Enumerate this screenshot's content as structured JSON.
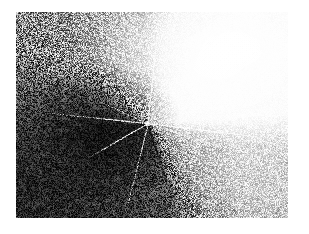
{
  "page": {
    "background_color": "#ffffff",
    "width": 309,
    "height": 234
  },
  "figure": {
    "name": "grainy-grayscale-micrograph",
    "kind": "photographic-plate",
    "plate": {
      "left": 16,
      "top": 12,
      "width": 272,
      "height": 206,
      "border": "none"
    },
    "node": {
      "label": "convergence-node",
      "x_pct": 48.5,
      "y_pct": 54,
      "image_x": 148,
      "image_y": 123
    },
    "grain": {
      "type": "film-grain",
      "strength": "high",
      "cell_px": 2
    },
    "domains": [
      {
        "name": "upper-right-bright-wedge",
        "tone": "near-white",
        "gray_value": 243,
        "hex": "#f3f3f3",
        "start_deg": 18,
        "end_deg": 100
      },
      {
        "name": "right-mid-gray-wedge",
        "tone": "light-gray",
        "gray_value": 200,
        "hex": "#c8c8c8",
        "start_deg": 100,
        "end_deg": 136
      },
      {
        "name": "lower-right-medium-wedge",
        "tone": "medium-gray",
        "gray_value": 152,
        "hex": "#989898",
        "start_deg": 136,
        "end_deg": 160
      },
      {
        "name": "lower-dark-wedge",
        "tone": "very-dark",
        "gray_value": 42,
        "hex": "#2a2a2a",
        "start_deg": 160,
        "end_deg": 268
      },
      {
        "name": "left-dark-wedge",
        "tone": "dark-gray",
        "gray_value": 62,
        "hex": "#3e3e3e",
        "start_deg": 268,
        "end_deg": 300
      },
      {
        "name": "upper-left-field",
        "tone": "mid-gray",
        "gray_value": 140,
        "hex": "#8c8c8c",
        "start_deg": 300,
        "end_deg": 18
      }
    ],
    "spokes": [
      {
        "name": "spoke-up",
        "angle_deg": -84,
        "length_pct": 42,
        "brightness": "bright",
        "style": "thin"
      },
      {
        "name": "spoke-up-right",
        "angle_deg": -58,
        "length_pct": 30,
        "brightness": "bright",
        "style": "dim"
      },
      {
        "name": "spoke-right",
        "angle_deg": 7,
        "length_pct": 50,
        "brightness": "bright",
        "style": "thin"
      },
      {
        "name": "spoke-right-low",
        "angle_deg": 18,
        "length_pct": 34,
        "brightness": "bright",
        "style": "dim"
      },
      {
        "name": "spoke-down-right",
        "angle_deg": 72,
        "length_pct": 40,
        "brightness": "dark",
        "style": "dark"
      },
      {
        "name": "spoke-down",
        "angle_deg": 104,
        "length_pct": 36,
        "brightness": "bright",
        "style": "dim"
      },
      {
        "name": "spoke-down-left",
        "angle_deg": 150,
        "length_pct": 26,
        "brightness": "bright",
        "style": "thin"
      },
      {
        "name": "spoke-left",
        "angle_deg": 186,
        "length_pct": 38,
        "brightness": "bright",
        "style": "thin"
      },
      {
        "name": "spoke-left-up",
        "angle_deg": 205,
        "length_pct": 20,
        "brightness": "bright",
        "style": "dim"
      }
    ]
  }
}
